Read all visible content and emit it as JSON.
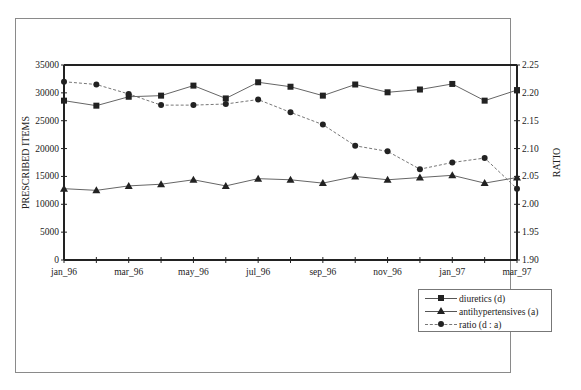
{
  "chart_data": {
    "type": "line",
    "title": "",
    "xlabel": "",
    "ylabel": "PRESCRIBED ITEMS",
    "y2label": "RATIO",
    "x": [
      "jan_96",
      "feb_96",
      "mar_96",
      "apr_96",
      "may_96",
      "jun_96",
      "jul_96",
      "aug_96",
      "sep_96",
      "oct_96",
      "nov_96",
      "dec_96",
      "jan_97",
      "feb_97",
      "mar_97"
    ],
    "x_tick_labels": [
      "jan_96",
      "mar_96",
      "may_96",
      "jul_96",
      "sep_96",
      "nov_96",
      "jan_97",
      "mar_97"
    ],
    "ylim": [
      0,
      35000
    ],
    "y_ticks": [
      0,
      5000,
      10000,
      15000,
      20000,
      25000,
      30000,
      35000
    ],
    "y2lim": [
      1.9,
      2.25
    ],
    "y2_ticks": [
      "1.90",
      "1.95",
      "2.00",
      "2.05",
      "2.10",
      "2.15",
      "2.20",
      "2.25"
    ],
    "grid": false,
    "legend_position": "bottom-right",
    "series": [
      {
        "name": "diuretics (d)",
        "axis": "left",
        "marker": "square",
        "line": "solid",
        "values": [
          28600,
          27700,
          29300,
          29500,
          31300,
          29000,
          31900,
          31100,
          29500,
          31500,
          30100,
          30600,
          31600,
          28600,
          30500
        ]
      },
      {
        "name": "antihypertensives (a)",
        "axis": "left",
        "marker": "triangle",
        "line": "solid",
        "values": [
          12800,
          12500,
          13300,
          13600,
          14400,
          13300,
          14600,
          14400,
          13800,
          15000,
          14400,
          14800,
          15200,
          13800,
          14800
        ]
      },
      {
        "name": "ratio (d : a)",
        "axis": "right",
        "marker": "circle",
        "line": "dashed",
        "values": [
          2.22,
          2.215,
          2.198,
          2.178,
          2.178,
          2.18,
          2.188,
          2.165,
          2.143,
          2.105,
          2.095,
          2.063,
          2.075,
          2.083,
          2.028
        ]
      }
    ]
  },
  "legend": {
    "items": [
      {
        "label": "diuretics (d)",
        "marker": "square"
      },
      {
        "label": "antihypertensives (a)",
        "marker": "triangle"
      },
      {
        "label": "ratio (d : a)",
        "marker": "circle"
      }
    ]
  },
  "axes": {
    "left_title": "PRESCRIBED ITEMS",
    "right_title": "RATIO"
  }
}
